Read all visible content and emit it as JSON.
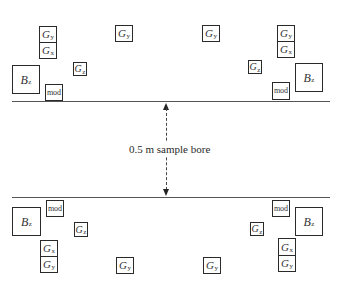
{
  "diagram": {
    "label": "0.5 m sample bore",
    "colors": {
      "stroke": "#2a2a2a",
      "line": "#555555",
      "background": "#ffffff"
    },
    "coils": {
      "top_left": {
        "gy": {
          "symbol": "G",
          "sub": "y"
        },
        "gx": {
          "symbol": "G",
          "sub": "x"
        },
        "gz": {
          "symbol": "G",
          "sub": "z"
        },
        "bz": {
          "symbol": "B",
          "sub": "z"
        },
        "mod": {
          "label": "mod"
        }
      },
      "top_center_left": {
        "gy": {
          "symbol": "G",
          "sub": "y"
        }
      },
      "top_center_right": {
        "gy": {
          "symbol": "G",
          "sub": "y"
        }
      },
      "top_right": {
        "gy": {
          "symbol": "G",
          "sub": "y"
        },
        "gx": {
          "symbol": "G",
          "sub": "x"
        },
        "gz": {
          "symbol": "G",
          "sub": "z"
        },
        "bz": {
          "symbol": "B",
          "sub": "z"
        },
        "mod": {
          "label": "mod"
        }
      },
      "bottom_left": {
        "gx": {
          "symbol": "G",
          "sub": "x"
        },
        "gy": {
          "symbol": "G",
          "sub": "y"
        },
        "gz": {
          "symbol": "G",
          "sub": "z"
        },
        "bz": {
          "symbol": "B",
          "sub": "z"
        },
        "mod": {
          "label": "mod"
        }
      },
      "bottom_center_left": {
        "gy": {
          "symbol": "G",
          "sub": "y"
        }
      },
      "bottom_center_right": {
        "gy": {
          "symbol": "G",
          "sub": "y"
        }
      },
      "bottom_right": {
        "gx": {
          "symbol": "G",
          "sub": "x"
        },
        "gy": {
          "symbol": "G",
          "sub": "y"
        },
        "gz": {
          "symbol": "G",
          "sub": "z"
        },
        "bz": {
          "symbol": "B",
          "sub": "z"
        },
        "mod": {
          "label": "mod"
        }
      }
    }
  }
}
